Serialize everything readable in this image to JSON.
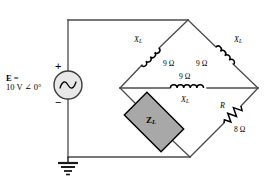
{
  "diagram": {
    "colors": {
      "wire": "#4a4a4a",
      "text": "#000000",
      "box_fill": "#a8a8a8",
      "box_stroke": "#000000",
      "source_fill": "#e8e8e8",
      "background": "#ffffff"
    }
  },
  "source": {
    "name": "voltage-source",
    "label_line1": "E =",
    "label_line2": "10 V ∠ 0°",
    "symbol": "ac-sine",
    "plus_sign": "+",
    "minus_sign": "−",
    "magnitude": "10",
    "unit": "V",
    "phase": "0°"
  },
  "ground": {
    "name": "ground",
    "symbol": "earth-ground"
  },
  "components": {
    "inductor_top_left": {
      "symbol": "X",
      "subscript": "L",
      "value": "9 Ω"
    },
    "inductor_top_right": {
      "symbol": "X",
      "subscript": "L",
      "value": "9 Ω"
    },
    "inductor_middle": {
      "symbol": "X",
      "subscript": "L",
      "value": "9 Ω"
    },
    "resistor": {
      "symbol": "R",
      "value": "8 Ω"
    },
    "load": {
      "symbol": "Z",
      "subscript": "L"
    }
  }
}
